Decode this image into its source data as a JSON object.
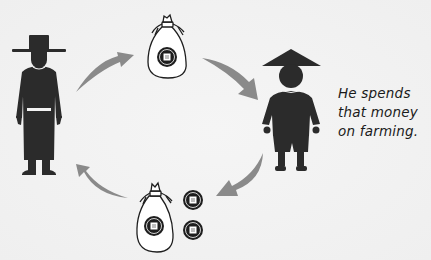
{
  "diagram": {
    "type": "money-cycle",
    "caption": {
      "lines": [
        "He spends",
        "that money",
        "on farming."
      ]
    },
    "figures": [
      {
        "id": "official",
        "label": "official-figure",
        "position": "left",
        "hat": "wide-brim-hat"
      },
      {
        "id": "farmer",
        "label": "farmer-figure",
        "position": "right",
        "hat": "conical-hat"
      }
    ],
    "money": [
      {
        "id": "top-bag",
        "label": "money-bag",
        "position": "top",
        "coins_inside": 1,
        "loose_coins": 0
      },
      {
        "id": "bottom-bag",
        "label": "money-bag",
        "position": "bottom",
        "coins_inside": 1,
        "loose_coins": 2
      }
    ],
    "arrows": [
      {
        "from": "official",
        "to": "top-bag",
        "direction": "up-right"
      },
      {
        "from": "top-bag",
        "to": "farmer",
        "direction": "down-right"
      },
      {
        "from": "farmer",
        "to": "bottom-bag",
        "direction": "down-left"
      },
      {
        "from": "bottom-bag",
        "to": "official",
        "direction": "up-left"
      }
    ],
    "colors": {
      "background": "#f3f3f3",
      "silhouette": "#2b2b2b",
      "arrow": "#888888",
      "outline": "#1e1e1e"
    }
  }
}
